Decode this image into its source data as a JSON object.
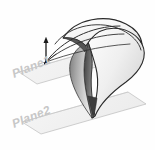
{
  "figure": {
    "background_color": "#fefefe",
    "width": 155,
    "height": 150
  },
  "labels": {
    "plane1": "Plane1",
    "plane2": "Plane2"
  },
  "colors": {
    "plane_fill": "#f2f2f2",
    "plane_stroke": "#b9b9b9",
    "label_color": "#c9c9c9",
    "outline": "#2a2a2a",
    "guide_curve": "#3a3a3a",
    "arrow": "#1a1a1a",
    "surface_light": "#ffffff",
    "surface_mid": "#d6d6d6",
    "surface_dark": "#8a8a8a",
    "surface_shadow": "#5a5a5a"
  },
  "geometry": {
    "plane1_name": "plane1-parallelogram",
    "plane2_name": "plane2-parallelogram",
    "loft_body_name": "lofted-surface-body",
    "direction_arrow_name": "direction-arrow",
    "guide_curve_count": 3
  }
}
